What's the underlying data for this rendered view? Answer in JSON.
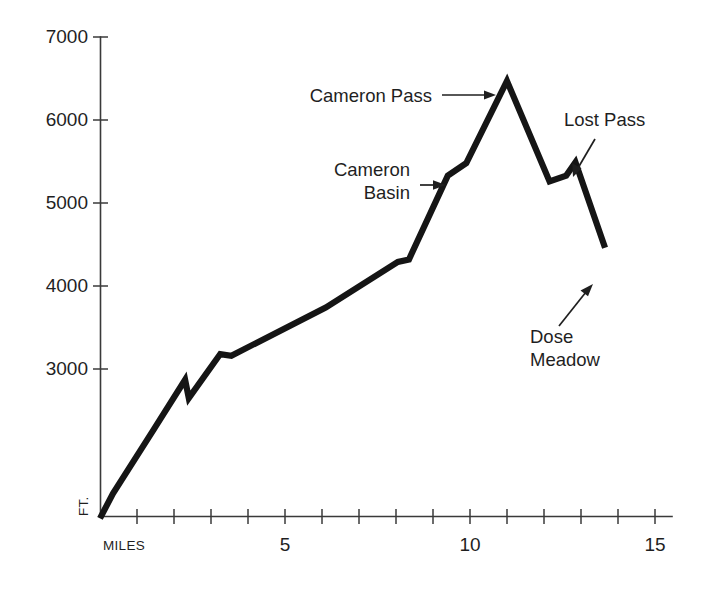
{
  "chart_data": {
    "type": "line",
    "title": "",
    "subtitle": "",
    "xlabel": "MILES",
    "ylabel": "FT.",
    "xlim": [
      0,
      15.6
    ],
    "ylim": [
      1200,
      7000
    ],
    "grid": false,
    "legend_position": "none",
    "x_ticks_major": [
      5,
      10,
      15
    ],
    "x_ticks_minor": [
      1,
      2,
      3,
      4,
      6,
      7,
      8,
      9,
      11,
      12,
      13,
      14
    ],
    "x_tick_labels": [
      "5",
      "10",
      "15"
    ],
    "y_ticks": [
      3000,
      4000,
      5000,
      6000,
      7000
    ],
    "y_tick_labels": [
      "3000",
      "4000",
      "5000",
      "6000",
      "7000"
    ],
    "series": [
      {
        "name": "Elevation profile",
        "x": [
          0.0,
          0.35,
          1.45,
          2.3,
          2.4,
          3.25,
          3.55,
          6.1,
          8.05,
          8.35,
          9.4,
          9.9,
          11.0,
          12.15,
          12.6,
          12.85,
          13.65
        ],
        "values": [
          1200,
          1500,
          2270,
          2870,
          2650,
          3180,
          3160,
          3740,
          4290,
          4320,
          5330,
          5480,
          6470,
          5260,
          5330,
          5490,
          4460
        ]
      }
    ],
    "annotations": [
      {
        "id": "cameron-pass",
        "label": "Cameron Pass",
        "lines": [
          "Cameron Pass"
        ],
        "x": 11.0,
        "value": 6470,
        "arrow": "right"
      },
      {
        "id": "cameron-basin",
        "label": "Cameron Basin",
        "lines": [
          "Cameron",
          "Basin"
        ],
        "x": 9.4,
        "value": 5330,
        "arrow": "right"
      },
      {
        "id": "lost-pass",
        "label": "Lost Pass",
        "lines": [
          "Lost Pass"
        ],
        "x": 12.85,
        "value": 5490,
        "arrow": "down-left"
      },
      {
        "id": "dose-meadow",
        "label": "Dose Meadow",
        "lines": [
          "Dose",
          "Meadow"
        ],
        "x": 13.65,
        "value": 4460,
        "arrow": "up-right"
      }
    ],
    "colors": {
      "background": "#ffffff",
      "line": "#151515",
      "axis": "#3a3a3a",
      "text": "#1f1f1f"
    }
  },
  "axes": {
    "y_label": "FT.",
    "x_label": "MILES",
    "y_tick_labels": [
      "7000",
      "6000",
      "5000",
      "4000",
      "3000"
    ],
    "x_tick_labels": [
      "5",
      "10",
      "15"
    ]
  },
  "annotations": {
    "cameron_pass": "Cameron Pass",
    "cameron_basin_line1": "Cameron",
    "cameron_basin_line2": "Basin",
    "lost_pass": "Lost Pass",
    "dose_meadow_line1": "Dose",
    "dose_meadow_line2": "Meadow"
  }
}
